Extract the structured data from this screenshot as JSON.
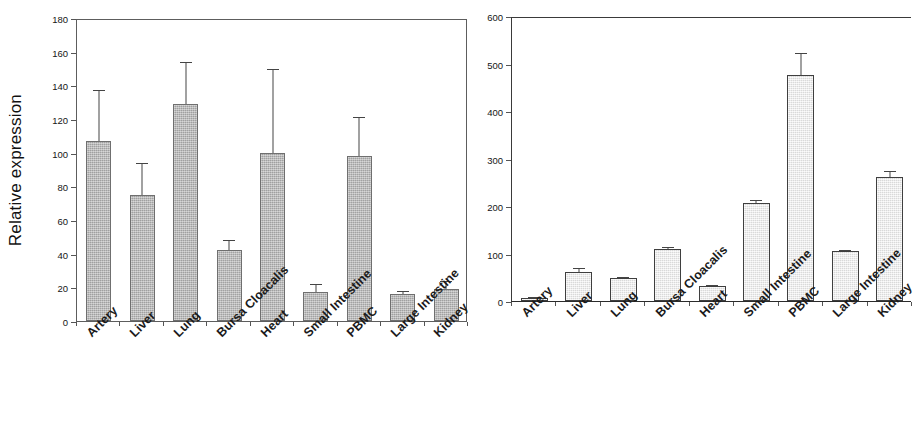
{
  "figure": {
    "panels": [
      "left",
      "right"
    ]
  },
  "left": {
    "ylabel": "Relative expression",
    "yticks": [
      "0",
      "20",
      "40",
      "60",
      "80",
      "100",
      "120",
      "140",
      "160",
      "180"
    ]
  },
  "right": {
    "ylabel": "",
    "yticks": [
      "0",
      "100",
      "200",
      "300",
      "400",
      "500",
      "600"
    ]
  },
  "categories": [
    "Artery",
    "Liver",
    "Lung",
    "Bursa Cloacalis",
    "Heart",
    "Small Intestine",
    "PBMC",
    "Large Intestine",
    "Kidney"
  ],
  "colors": {
    "left_bar_fill": "#b4b4b4",
    "left_bar_stroke": "#6f6f6f",
    "right_bar_fill": "#eeeeee",
    "right_bar_stroke": "#3f3f3f",
    "axis": "#555555",
    "text": "#1a1a1a"
  },
  "chart_data": [
    {
      "type": "bar",
      "title": "",
      "panel": "left",
      "xlabel": "",
      "ylabel": "Relative expression",
      "ylim": [
        0,
        180
      ],
      "ytick_step": 20,
      "grid": false,
      "legend": "none",
      "categories": [
        "Artery",
        "Liver",
        "Lung",
        "Bursa Cloacalis",
        "Heart",
        "Small Intestine",
        "PBMC",
        "Large Intestine",
        "Kidney"
      ],
      "values": [
        107,
        75,
        129,
        42,
        100,
        17,
        98,
        16,
        19
      ],
      "errors": [
        30,
        19,
        25,
        6,
        50,
        5,
        23,
        2,
        5
      ],
      "error_type": "standard deviation"
    },
    {
      "type": "bar",
      "title": "",
      "panel": "right",
      "xlabel": "",
      "ylabel": "",
      "ylim": [
        0,
        600
      ],
      "ytick_step": 100,
      "grid": false,
      "legend": "none",
      "categories": [
        "Artery",
        "Liver",
        "Lung",
        "Bursa Cloacalis",
        "Heart",
        "Small Intestine",
        "PBMC",
        "Large Intestine",
        "Kidney"
      ],
      "values": [
        6,
        62,
        48,
        110,
        31,
        206,
        475,
        105,
        262
      ],
      "errors": [
        3,
        7,
        2,
        3,
        3,
        7,
        48,
        3,
        12
      ],
      "error_type": "standard deviation"
    }
  ]
}
